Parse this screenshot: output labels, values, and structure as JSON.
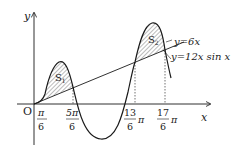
{
  "axes": {
    "x_label": "x",
    "y_label": "y",
    "origin_label": "O"
  },
  "curves": {
    "line_label": "y=6x",
    "curve_label": "y=12x sin x"
  },
  "regions": {
    "s1": "S",
    "s1_sub": "1",
    "s2": "S",
    "s2_sub": "2"
  },
  "ticks": [
    {
      "num": "π",
      "den": "6",
      "suffix": ""
    },
    {
      "num": "5π",
      "den": "6",
      "suffix": ""
    },
    {
      "num": "13",
      "den": "6",
      "suffix": "π"
    },
    {
      "num": "17",
      "den": "6",
      "suffix": "π"
    }
  ],
  "colors": {
    "stroke": "#1a1a1a",
    "hatch": "#555555"
  }
}
